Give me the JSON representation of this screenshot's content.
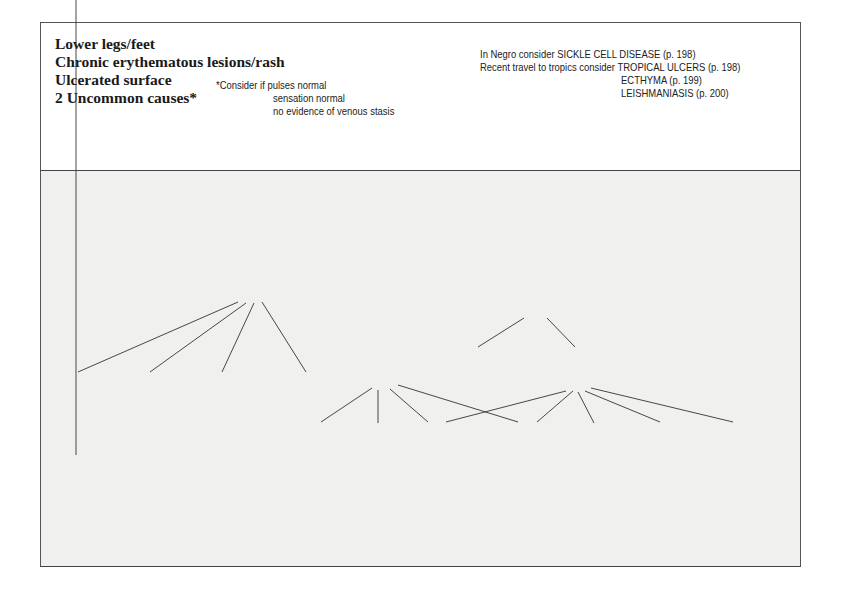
{
  "header": {
    "title_lines": [
      "Lower legs/feet",
      "Chronic erythematous lesions/rash",
      "Ulcerated surface",
      "2  Uncommon causes*"
    ],
    "footnote": [
      "*Consider if pulses normal",
      "sensation normal",
      "no evidence of venous stasis"
    ],
    "considerations": [
      "In Negro consider SICKLE CELL DISEASE (p. 198)",
      "Recent travel to tropics consider TROPICAL ULCERS (p. 198)",
      "ECTHYMA (p. 199)",
      "LEISHMANIASIS (p. 200)"
    ]
  },
  "tree": {
    "rash_around_ulcer": [
      "Rash around",
      "ulcer"
    ],
    "surrounding_skin_normal": [
      "Surrounding",
      "skin normal"
    ],
    "multiple_ulcers": [
      "Multiple",
      "ulcers"
    ],
    "usually_single": [
      "Usually",
      "single"
    ],
    "columns": [
      {
        "finding": [
          "Yellow",
          "plaque",
          "with telang-",
          "iectasia"
        ],
        "next": [
          "Front of",
          "shin only"
        ],
        "diagnosis": [
          "NECROBIOSIS",
          "LIPOIDICA"
        ],
        "ref": "[see p. 189]"
      },
      {
        "finding": [
          "Expanding",
          "erythema",
          "followed by",
          "skin necrosis"
        ],
        "next": [
          "Patient",
          "unwell"
        ],
        "diagnosis": [
          "NECROTIZING",
          "FASCIITIS"
        ],
        "ref": "[p. 198]"
      },
      {
        "finding": [
          "Skin",
          "atrophic",
          "Telang-",
          "iectasia"
        ],
        "next": [
          "Previous",
          "treatment"
        ],
        "diagnosis": [
          "STEROIDS OR",
          "RADIOTHERAPY"
        ],
        "ref": "[p. 199]"
      },
      {
        "finding": [
          "Associated",
          "purpura,",
          "papules,",
          "vesicles"
        ],
        "next": [
          "Biopsy"
        ],
        "diagnosis": [
          "VASCULITIS"
        ],
        "ref": "[see p. 204]"
      },
      {
        "finding": [
          "Odd",
          "shape"
        ],
        "next": [
          "Linear/",
          "angular"
        ],
        "diagnosis": [
          "DERMATITIS",
          "ARTEFACTA"
        ],
        "ref": "[p. 199]"
      },
      {
        "finding": [
          "Undermined",
          "edge",
          "Violaceous",
          "border"
        ],
        "next": [
          "Rapid",
          "growth"
        ],
        "diagnosis": [
          "PYODERMA",
          "GANGRENOSUM"
        ],
        "ref": "[p. 199]"
      },
      {
        "finding": [
          "Remove",
          "crust:",
          "pus",
          "underneath"
        ],
        "next": [
          "Bacteriology",
          "Staph. aureus",
          "+ + +"
        ],
        "diagnosis": [
          "ECTHYMA"
        ],
        "ref": "[p. 199]"
      },
      {
        "finding": [
          "Slow",
          "growth"
        ],
        "next": [
          "Biopsy"
        ],
        "diagnosis": [
          "SKIN",
          "NEOPLASM"
        ],
        "ref": "[p. 200]"
      },
      {
        "finding": [
          "Underlying",
          "bruit"
        ],
        "next": [],
        "diagnosis": [
          "ARTERIO-",
          "VENOUS",
          "ANASTOMOSIS"
        ],
        "ref": "[p. 200]"
      },
      {
        "finding": [
          "Rapid",
          "growth"
        ],
        "next": [
          "Check",
          "VDRL"
        ],
        "diagnosis": [
          "SYPHILITIC",
          "GUMMA"
        ],
        "ref": "[p. 200]"
      }
    ]
  },
  "colors": {
    "panel_bg": "#f0f0ee",
    "border": "#555555",
    "text": "#222222"
  }
}
